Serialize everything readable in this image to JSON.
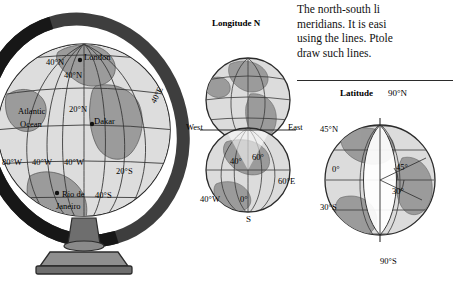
{
  "text": {
    "lines": [
      "The north-south  li",
      "meridians. It is easi",
      "using the lines. Ptole",
      "draw such lines."
    ]
  },
  "globe": {
    "name": "world-globe-on-stand",
    "labels": [
      {
        "text": "40°N",
        "x": 46,
        "y": 57
      },
      {
        "text": "40°N",
        "x": 64,
        "y": 70
      },
      {
        "text": "London",
        "x": 84,
        "y": 58
      },
      {
        "text": "Atlantic",
        "x": 20,
        "y": 112
      },
      {
        "text": "Ocean",
        "x": 22,
        "y": 125
      },
      {
        "text": "20°N",
        "x": 69,
        "y": 110
      },
      {
        "text": "Dakar",
        "x": 94,
        "y": 122
      },
      {
        "text": "40°E",
        "x": 150,
        "y": 97
      },
      {
        "text": "80°W",
        "x": 4,
        "y": 163
      },
      {
        "text": "40°W",
        "x": 34,
        "y": 163
      },
      {
        "text": "40°W",
        "x": 64,
        "y": 163
      },
      {
        "text": "20°S",
        "x": 118,
        "y": 172
      },
      {
        "text": "Rio de",
        "x": 62,
        "y": 195
      },
      {
        "text": "Janeiro",
        "x": 58,
        "y": 207
      },
      {
        "text": "40°S",
        "x": 95,
        "y": 196
      }
    ]
  },
  "mid": {
    "name": "longitude-hemisphere-diagram",
    "labels": [
      {
        "text": "Longitude N",
        "x": 30,
        "y": 2
      },
      {
        "text": "West",
        "x": 0,
        "y": 110
      },
      {
        "text": "East",
        "x": 104,
        "y": 110
      },
      {
        "text": "40°",
        "x": 44,
        "y": 143
      },
      {
        "text": "60°",
        "x": 66,
        "y": 140
      },
      {
        "text": "60°E",
        "x": 96,
        "y": 163
      },
      {
        "text": "40°W",
        "x": 18,
        "y": 180
      },
      {
        "text": "0°",
        "x": 55,
        "y": 180
      },
      {
        "text": "S",
        "x": 62,
        "y": 200
      }
    ]
  },
  "right": {
    "name": "latitude-globe-diagram",
    "labels": [
      {
        "text": "Latitude",
        "x": 30,
        "y": 0
      },
      {
        "text": "90°N",
        "x": 72,
        "y": 0
      },
      {
        "text": "45°N",
        "x": 8,
        "y": 40
      },
      {
        "text": "45°",
        "x": 78,
        "y": 78
      },
      {
        "text": "0°",
        "x": 18,
        "y": 80
      },
      {
        "text": "30°",
        "x": 74,
        "y": 100
      },
      {
        "text": "30°S",
        "x": 8,
        "y": 118
      },
      {
        "text": "90°S",
        "x": 66,
        "y": 172
      }
    ]
  },
  "colors": {
    "land": "#9a9a9a",
    "ocean": "#d9d9d9",
    "grid": "#3a3a3a",
    "stand": "#5a5a5a",
    "ink": "#111111"
  }
}
